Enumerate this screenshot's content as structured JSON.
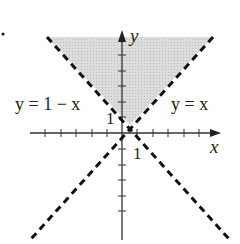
{
  "diagram": {
    "type": "inequality-region",
    "colors": {
      "shade": "#d4d4d4",
      "line": "#111111",
      "axis": "#333333"
    },
    "axes": {
      "x_label": "x",
      "y_label": "y",
      "x_tick_label": "1",
      "y_tick_label": "1",
      "x_ticks_negative": 5,
      "x_ticks_positive": 4,
      "y_ticks_positive": 5,
      "y_ticks_negative": 5
    },
    "lines": [
      {
        "id": "line-y-eq-1-minus-x",
        "label": "y = 1 − x",
        "style": "dashed"
      },
      {
        "id": "line-y-eq-x",
        "label": "y = x",
        "style": "dashed"
      }
    ],
    "region": {
      "vertex": "(1/2, 1/2)",
      "shaded": true
    }
  }
}
